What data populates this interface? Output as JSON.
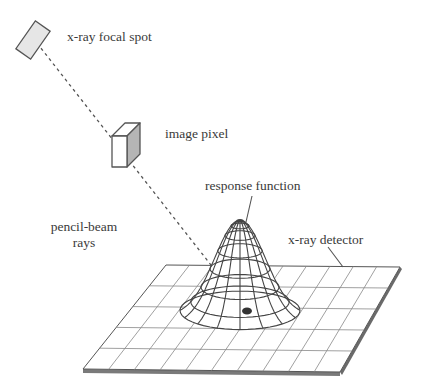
{
  "diagram": {
    "labels": {
      "focal_spot": "x-ray focal spot",
      "image_pixel": "image pixel",
      "response_function": "response function",
      "pencil_beam_line1": "pencil-beam",
      "pencil_beam_line2": "rays",
      "detector": "x-ray detector"
    },
    "colors": {
      "line": "#555555",
      "fill_light": "#e6e6e6",
      "fill_shade": "#b5b5b5",
      "detector_edge": "#666666",
      "background": "#ffffff"
    },
    "detector_grid": {
      "columns": 10,
      "rows": 5
    }
  }
}
